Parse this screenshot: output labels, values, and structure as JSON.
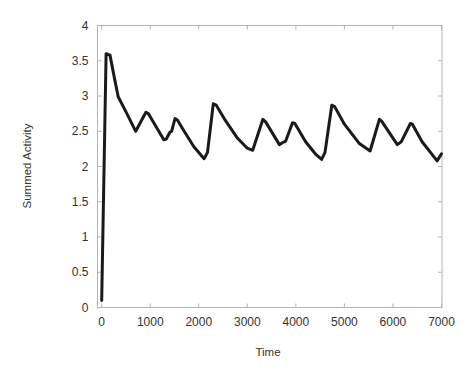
{
  "chart_data": {
    "type": "line",
    "title": "",
    "xlabel": "Time",
    "ylabel": "Summed Activity",
    "xlim": [
      0,
      7000
    ],
    "ylim": [
      0,
      4
    ],
    "xticks": [
      0,
      1000,
      2000,
      3000,
      4000,
      5000,
      6000,
      7000
    ],
    "yticks": [
      0,
      0.5,
      1,
      1.5,
      2,
      2.5,
      3,
      3.5,
      4
    ],
    "xtick_labels": [
      "0",
      "1000",
      "2000",
      "3000",
      "4000",
      "5000",
      "6000",
      "7000"
    ],
    "ytick_labels": [
      "0",
      "0.5",
      "1",
      "1.5",
      "2",
      "2.5",
      "3",
      "3.5",
      "4"
    ],
    "grid": false,
    "legend": null,
    "series": [
      {
        "name": "Summed Activity",
        "color": "#1a1a1a",
        "x": [
          0,
          90,
          170,
          250,
          340,
          520,
          700,
          910,
          960,
          1280,
          1330,
          1410,
          1440,
          1510,
          1560,
          1700,
          1900,
          2110,
          2180,
          2300,
          2360,
          2550,
          2800,
          3000,
          3110,
          3320,
          3380,
          3660,
          3730,
          3790,
          3930,
          3980,
          4200,
          4400,
          4530,
          4600,
          4740,
          4800,
          5000,
          5300,
          5530,
          5720,
          5770,
          6090,
          6170,
          6360,
          6400,
          6600,
          6910,
          7000
        ],
        "y": [
          0.1,
          3.6,
          3.58,
          3.3,
          2.99,
          2.75,
          2.5,
          2.77,
          2.75,
          2.38,
          2.39,
          2.49,
          2.5,
          2.68,
          2.66,
          2.5,
          2.28,
          2.11,
          2.2,
          2.89,
          2.87,
          2.65,
          2.4,
          2.26,
          2.23,
          2.67,
          2.63,
          2.31,
          2.34,
          2.36,
          2.62,
          2.61,
          2.35,
          2.18,
          2.1,
          2.2,
          2.87,
          2.85,
          2.6,
          2.33,
          2.22,
          2.67,
          2.64,
          2.31,
          2.35,
          2.61,
          2.6,
          2.35,
          2.08,
          2.18
        ]
      }
    ]
  },
  "frame": {
    "axis_color": "#b4b4b4",
    "text_color": "#333333"
  }
}
